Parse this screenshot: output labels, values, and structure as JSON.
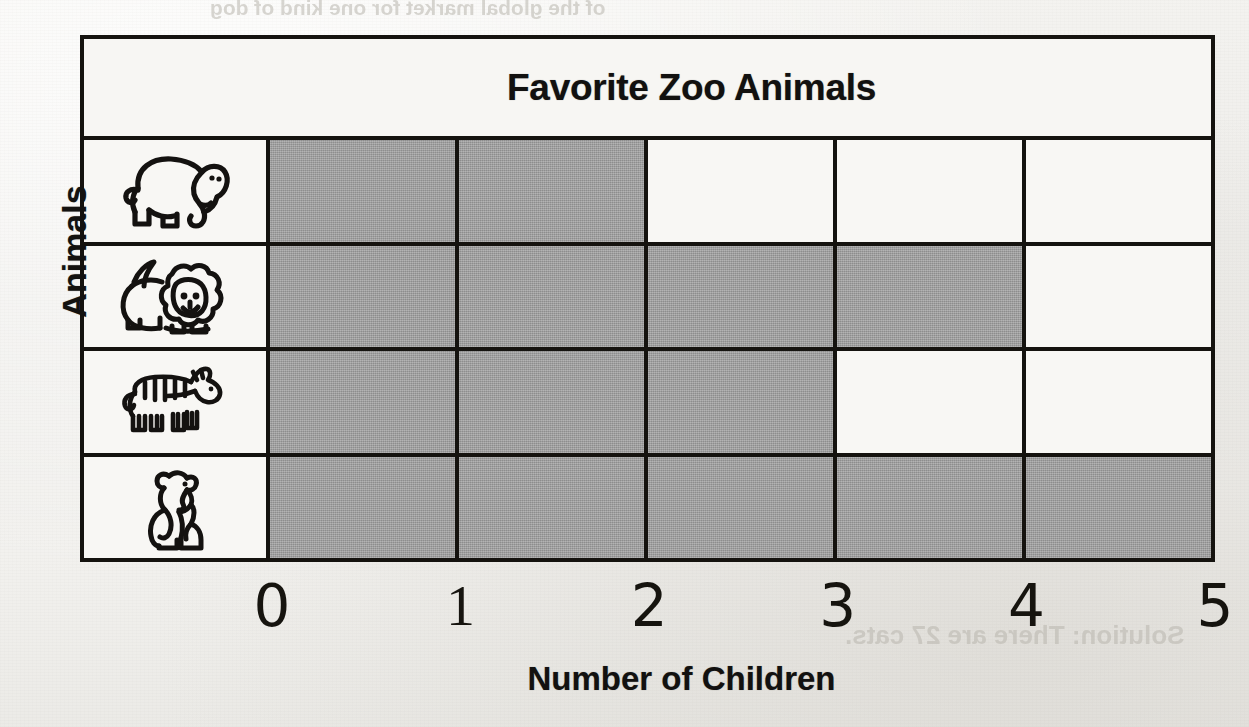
{
  "page": {
    "background_color": "#f1f0ed",
    "ghost_texts": [
      {
        "text": "of the global market for one kind of dog",
        "x": 210,
        "y": -4,
        "size": 21
      },
      {
        "text": "Work in pairs or in a small group",
        "x": 430,
        "y": 96,
        "size": 24
      },
      {
        "text": "Solution: There are 27 cats.",
        "x": 845,
        "y": 620,
        "size": 26
      },
      {
        "text": "5",
        "x": 780,
        "y": 160,
        "size": 30
      },
      {
        "text": "X",
        "x": 700,
        "y": 350,
        "size": 28
      },
      {
        "text": "10",
        "x": 740,
        "y": 385,
        "size": 24
      }
    ]
  },
  "chart_data": {
    "type": "bar",
    "orientation": "horizontal",
    "title": "Favorite Zoo Animals",
    "xlabel": "Number of Children",
    "ylabel": "Animals",
    "categories": [
      "elephant",
      "lion",
      "zebra",
      "bear"
    ],
    "values": [
      2,
      4,
      3,
      5
    ],
    "x_ticks": [
      "0",
      "1",
      "2",
      "3",
      "4",
      "5"
    ],
    "xlim": [
      0,
      5
    ],
    "grid": true,
    "legend": "none",
    "bar_color": "#9d9d9d",
    "line_color": "#15130f",
    "rows": [
      {
        "icon": "elephant-icon",
        "label": "Elephant",
        "value": 2
      },
      {
        "icon": "lion-icon",
        "label": "Lion",
        "value": 4
      },
      {
        "icon": "zebra-icon",
        "label": "Zebra",
        "value": 3
      },
      {
        "icon": "bear-icon",
        "label": "Bear",
        "value": 5
      }
    ]
  }
}
